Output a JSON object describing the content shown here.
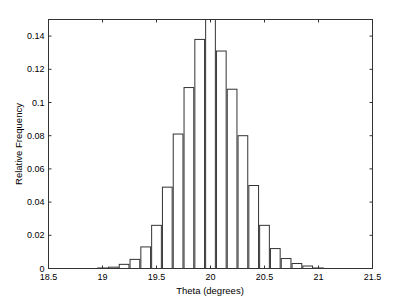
{
  "chart_data": {
    "type": "bar",
    "title": "",
    "xlabel": "Theta (degrees)",
    "ylabel": "Relative Frequency",
    "xlim": [
      18.5,
      21.5
    ],
    "ylim": [
      0,
      0.15
    ],
    "xticks": [
      "18.5",
      "19",
      "19.5",
      "20",
      "20.5",
      "21",
      "21.5"
    ],
    "yticks": [
      "0",
      "0.02",
      "0.04",
      "0.06",
      "0.08",
      "0.1",
      "0.12",
      "0.14"
    ],
    "grid": false,
    "legend": null,
    "bin_width": 0.1,
    "categories": [
      19.0,
      19.1,
      19.2,
      19.3,
      19.4,
      19.5,
      19.6,
      19.7,
      19.8,
      19.9,
      20.0,
      20.1,
      20.2,
      20.3,
      20.4,
      20.5,
      20.6,
      20.7,
      20.8,
      20.9,
      21.0
    ],
    "values": [
      0.0003,
      0.0008,
      0.0025,
      0.0055,
      0.013,
      0.026,
      0.049,
      0.081,
      0.109,
      0.138,
      0.152,
      0.131,
      0.108,
      0.08,
      0.05,
      0.026,
      0.012,
      0.006,
      0.003,
      0.0015,
      0.0003
    ],
    "colors": {
      "bar_fill": "#ffffff",
      "bar_edge": "#333333",
      "axis": "#333333"
    }
  }
}
